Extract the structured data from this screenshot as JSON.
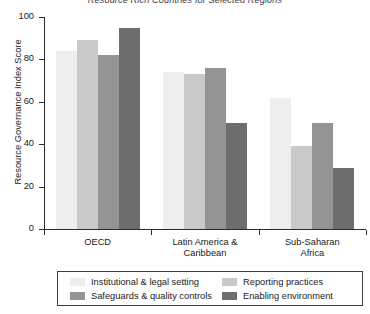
{
  "chart_data": {
    "type": "bar",
    "title": "Resource Rich Countries for Selected Regions",
    "xlabel": "",
    "ylabel": "Resource Governance Index Score",
    "ylim": [
      0,
      100
    ],
    "yticks": [
      0,
      20,
      40,
      60,
      80,
      100
    ],
    "ytick_labels": [
      "0",
      "20",
      "40",
      "60",
      "80",
      "100"
    ],
    "grid": false,
    "legend_position": "bottom",
    "categories": [
      "OECD",
      "Latin America & Caribbean",
      "Sub-Saharan Africa"
    ],
    "category_lines": [
      [
        "OECD"
      ],
      [
        "Latin America &",
        "Caribbean"
      ],
      [
        "Sub-Saharan",
        "Africa"
      ]
    ],
    "series": [
      {
        "name": "Institutional & legal setting",
        "color": "#eeeeee",
        "values": [
          84,
          74,
          62
        ]
      },
      {
        "name": "Reporting practices",
        "color": "#c9c9c9",
        "values": [
          89,
          73,
          39
        ]
      },
      {
        "name": "Safeguards & quality controls",
        "color": "#949494",
        "values": [
          82,
          76,
          50
        ]
      },
      {
        "name": "Enabling environment",
        "color": "#6e6e6e",
        "values": [
          95,
          50,
          29
        ]
      }
    ]
  },
  "legend": {
    "entries": [
      {
        "label": "Institutional & legal setting",
        "color": "#eeeeee"
      },
      {
        "label": "Reporting practices",
        "color": "#c9c9c9"
      },
      {
        "label": "Safeguards & quality controls",
        "color": "#949494"
      },
      {
        "label": "Enabling environment",
        "color": "#6e6e6e"
      }
    ]
  },
  "style": {
    "axis_color": "#2b2b2b",
    "text_color": "#1a1a1a",
    "background": "#ffffff",
    "bar_border": "#8a8a8a"
  }
}
